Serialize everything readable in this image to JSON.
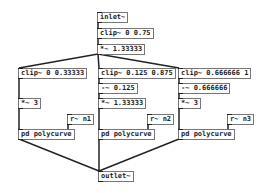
{
  "patch": {
    "objects": [
      {
        "id": "inlet",
        "label": "inlet~",
        "x": 97,
        "y": 12
      },
      {
        "id": "clip_main",
        "label": "clip~ 0 0.75",
        "x": 97,
        "y": 28
      },
      {
        "id": "mul_main",
        "label": "*~ 1.33333",
        "x": 97,
        "y": 44
      },
      {
        "id": "clip1",
        "label": "clip~ 0 0.33333",
        "x": 18,
        "y": 68
      },
      {
        "id": "clip2",
        "label": "clip~ 0.125 0.875",
        "x": 98,
        "y": 68
      },
      {
        "id": "clip3",
        "label": "clip~ 0.666666 1",
        "x": 178,
        "y": 68
      },
      {
        "id": "sub2",
        "label": "-~ 0.125",
        "x": 98,
        "y": 83
      },
      {
        "id": "sub3",
        "label": "-~ 0.666666",
        "x": 178,
        "y": 83
      },
      {
        "id": "mul1",
        "label": "*~ 3",
        "x": 18,
        "y": 98
      },
      {
        "id": "mul2",
        "label": "*~ 1.33333",
        "x": 98,
        "y": 98
      },
      {
        "id": "mul3",
        "label": "*~ 3",
        "x": 178,
        "y": 98
      },
      {
        "id": "r1",
        "label": "r~ n1",
        "x": 67,
        "y": 114
      },
      {
        "id": "r2",
        "label": "r~ n2",
        "x": 147,
        "y": 114
      },
      {
        "id": "r3",
        "label": "r~ n3",
        "x": 227,
        "y": 114
      },
      {
        "id": "pd1",
        "label": "pd polycurve",
        "x": 18,
        "y": 129
      },
      {
        "id": "pd2",
        "label": "pd polycurve",
        "x": 98,
        "y": 129
      },
      {
        "id": "pd3",
        "label": "pd polycurve",
        "x": 178,
        "y": 129
      },
      {
        "id": "outlet",
        "label": "outlet~",
        "x": 98,
        "y": 171
      }
    ],
    "connections": [
      [
        "inlet",
        "clip_main"
      ],
      [
        "clip_main",
        "mul_main"
      ],
      [
        "mul_main",
        "clip1"
      ],
      [
        "mul_main",
        "clip2"
      ],
      [
        "mul_main",
        "clip3"
      ],
      [
        "clip1",
        "mul1"
      ],
      [
        "clip2",
        "sub2"
      ],
      [
        "sub2",
        "mul2"
      ],
      [
        "clip3",
        "sub3"
      ],
      [
        "sub3",
        "mul3"
      ],
      [
        "mul1",
        "pd1"
      ],
      [
        "mul2",
        "pd2"
      ],
      [
        "mul3",
        "pd3"
      ],
      [
        "r1",
        "pd1"
      ],
      [
        "r2",
        "pd2"
      ],
      [
        "r3",
        "pd3"
      ],
      [
        "pd1",
        "outlet"
      ],
      [
        "pd2",
        "outlet"
      ],
      [
        "pd3",
        "outlet"
      ]
    ]
  }
}
